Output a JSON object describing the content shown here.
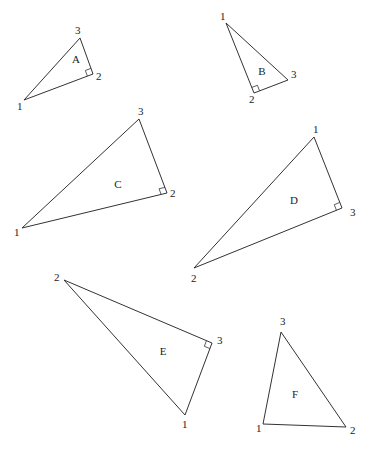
{
  "figure": {
    "triangles": [
      {
        "name": "A",
        "right_angle_at": "2",
        "label_pos": [
          76,
          63
        ],
        "vertices": [
          {
            "label": "1",
            "x": 24,
            "y": 100,
            "lx": 17,
            "ly": 110
          },
          {
            "label": "2",
            "x": 93,
            "y": 74,
            "lx": 96,
            "ly": 80
          },
          {
            "label": "3",
            "x": 80,
            "y": 38,
            "lx": 75,
            "ly": 34
          }
        ]
      },
      {
        "name": "B",
        "right_angle_at": "2",
        "label_pos": [
          262,
          75
        ],
        "vertices": [
          {
            "label": "1",
            "x": 226,
            "y": 23,
            "lx": 220,
            "ly": 20
          },
          {
            "label": "2",
            "x": 254,
            "y": 93,
            "lx": 249,
            "ly": 103
          },
          {
            "label": "3",
            "x": 288,
            "y": 80,
            "lx": 291,
            "ly": 78
          }
        ]
      },
      {
        "name": "C",
        "right_angle_at": "2",
        "label_pos": [
          118,
          188
        ],
        "vertices": [
          {
            "label": "1",
            "x": 22,
            "y": 228,
            "lx": 14,
            "ly": 236
          },
          {
            "label": "2",
            "x": 167,
            "y": 193,
            "lx": 170,
            "ly": 197
          },
          {
            "label": "3",
            "x": 139,
            "y": 119,
            "lx": 138,
            "ly": 115
          }
        ]
      },
      {
        "name": "D",
        "right_angle_at": "3",
        "label_pos": [
          294,
          204
        ],
        "vertices": [
          {
            "label": "1",
            "x": 314,
            "y": 137,
            "lx": 313,
            "ly": 133
          },
          {
            "label": "2",
            "x": 194,
            "y": 268,
            "lx": 191,
            "ly": 282
          },
          {
            "label": "3",
            "x": 342,
            "y": 208,
            "lx": 350,
            "ly": 216
          }
        ]
      },
      {
        "name": "E",
        "right_angle_at": "3",
        "label_pos": [
          163,
          355
        ],
        "vertices": [
          {
            "label": "1",
            "x": 185,
            "y": 415,
            "lx": 182,
            "ly": 428
          },
          {
            "label": "2",
            "x": 64,
            "y": 280,
            "lx": 54,
            "ly": 281
          },
          {
            "label": "3",
            "x": 212,
            "y": 343,
            "lx": 217,
            "ly": 344
          }
        ]
      },
      {
        "name": "F",
        "right_angle_at": null,
        "label_pos": [
          295,
          398
        ],
        "vertices": [
          {
            "label": "1",
            "x": 263,
            "y": 424,
            "lx": 256,
            "ly": 432
          },
          {
            "label": "2",
            "x": 346,
            "y": 427,
            "lx": 350,
            "ly": 434
          },
          {
            "label": "3",
            "x": 281,
            "y": 332,
            "lx": 280,
            "ly": 325
          }
        ]
      }
    ]
  }
}
